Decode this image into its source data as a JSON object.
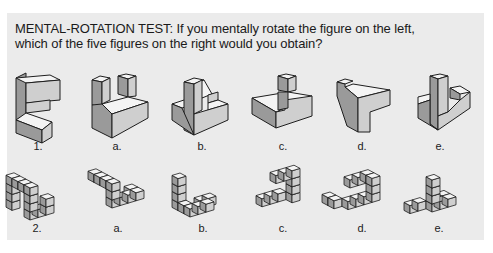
{
  "question": {
    "title_line1": "MENTAL-ROTATION TEST: If you mentally rotate the figure on the left,",
    "title_line2": "which of the five figures on the right would you obtain?"
  },
  "rows": [
    {
      "name": "solid-blocks",
      "labels": [
        "1.",
        "a.",
        "b.",
        "c.",
        "d.",
        "e."
      ]
    },
    {
      "name": "cube-stacks",
      "labels": [
        "2.",
        "a.",
        "b.",
        "c.",
        "d.",
        "e."
      ]
    }
  ],
  "colors": {
    "panel_bg": "#ebebeb",
    "top_face": "#f4f4f4",
    "left_face": "#9a9a9a",
    "right_face": "#cfcfcf",
    "edge": "#1e1e1e"
  }
}
